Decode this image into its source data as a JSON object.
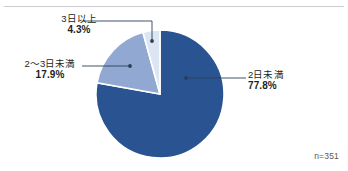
{
  "figure": {
    "width": 348,
    "height": 171,
    "background": "#ffffff",
    "rule_color": "#c9ccd1"
  },
  "sample_size": "n=351",
  "labels": {
    "top": {
      "category": "3日以上",
      "value": "4.3%"
    },
    "left": {
      "category": "2〜3日未満",
      "value": "17.9%"
    },
    "right": {
      "category": "2日未満",
      "value": "77.8%"
    }
  },
  "chart_data": {
    "type": "pie",
    "title": "",
    "subtitle": "",
    "xlabel": "",
    "ylabel": "",
    "legend": "none",
    "grid": false,
    "annotations": [
      "n=351"
    ],
    "start_angle_deg": -90,
    "direction": "clockwise",
    "total_responses": 351,
    "categories": [
      "2日未満",
      "2〜3日未満",
      "3日以上"
    ],
    "values": [
      77.8,
      17.9,
      4.3
    ],
    "value_labels": [
      "77.8%",
      "17.9%",
      "4.3%"
    ],
    "colors": [
      "#2a5491",
      "#91a9d2",
      "#dce5f2"
    ],
    "slice_border_color": "#ffffff",
    "slices": [
      {
        "label": "2日未満",
        "value": 77.8,
        "display": "77.8%",
        "color": "#2a5491"
      },
      {
        "label": "2〜3日未満",
        "value": 17.9,
        "display": "17.9%",
        "color": "#91a9d2"
      },
      {
        "label": "3日以上",
        "value": 4.3,
        "display": "4.3%",
        "color": "#dce5f2"
      }
    ],
    "leader_line_color": "#2c3e57"
  }
}
